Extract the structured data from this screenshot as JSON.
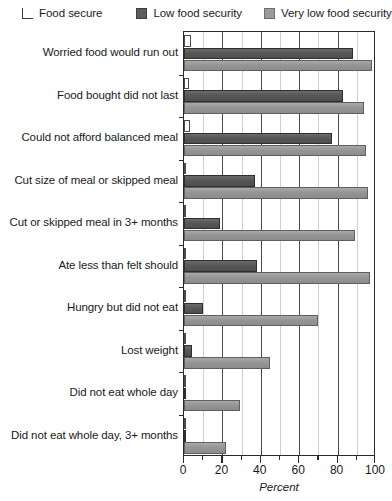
{
  "legend": {
    "position": "top",
    "items": [
      {
        "label": "Food secure",
        "swatch": "open-square-swatch",
        "color": "#ffffff"
      },
      {
        "label": "Low food security",
        "swatch": "dark-gray-square-swatch",
        "color": "#5d5d5d"
      },
      {
        "label": "Very low food security",
        "swatch": "light-gray-square-swatch",
        "color": "#9b9b9b"
      }
    ]
  },
  "axis": {
    "x_title": "Percent",
    "x_ticklabels": [
      "0",
      "20",
      "40",
      "60",
      "80",
      "100"
    ]
  },
  "chart_data": {
    "type": "bar",
    "orientation": "horizontal",
    "title": "",
    "xlabel": "Percent",
    "ylabel": "",
    "xlim": [
      0,
      100
    ],
    "xticks": [
      0,
      20,
      40,
      60,
      80,
      100
    ],
    "xminorticks": [
      10,
      30,
      50,
      70,
      90
    ],
    "grid": "vertical",
    "legend_position": "top",
    "categories": [
      "Worried food would run out",
      "Food bought did not last",
      "Could not afford balanced meal",
      "Cut size of meal or skipped meal",
      "Cut or skipped meal in 3+ months",
      "Ate less than felt should",
      "Hungry but did not eat",
      "Lost weight",
      "Did not eat whole day",
      "Did not eat whole day, 3+ months"
    ],
    "series": [
      {
        "name": "Food secure",
        "color": "#ffffff",
        "values": [
          3.5,
          2.5,
          3.0,
          0.3,
          0.2,
          0.3,
          0.2,
          0.2,
          0.2,
          0.1
        ]
      },
      {
        "name": "Low food security",
        "color": "#5d5d5d",
        "values": [
          88,
          83,
          77,
          37,
          19,
          38,
          10,
          4,
          1,
          0.5
        ]
      },
      {
        "name": "Very low food security",
        "color": "#9b9b9b",
        "values": [
          98,
          94,
          95,
          96,
          89,
          97,
          70,
          45,
          29,
          22
        ]
      }
    ]
  }
}
